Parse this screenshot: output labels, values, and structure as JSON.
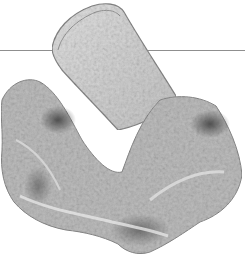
{
  "image": {
    "subject": "lace fabric garment",
    "style": "grayscale photograph",
    "background_color": "#ffffff",
    "rule_color": "#8f8f8f",
    "fabric_light": "#d9d9d9",
    "fabric_mid": "#a8a8a8",
    "fabric_dark": "#555555"
  }
}
